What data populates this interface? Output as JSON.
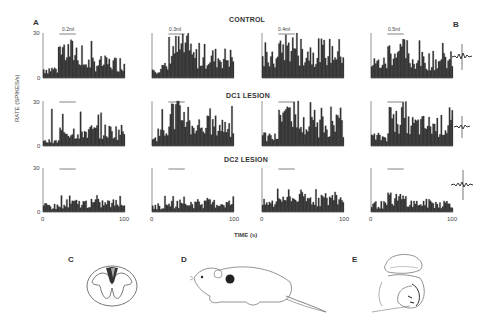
{
  "figure": {
    "panel_labels": [
      "A",
      "B",
      "C",
      "D",
      "E"
    ],
    "rows": [
      {
        "title": "CONTROL"
      },
      {
        "title": "DC1 LESION"
      },
      {
        "title": "DC2 LESION"
      }
    ],
    "stimulus_labels": [
      "0.2ml",
      "0.3ml",
      "0.4ml",
      "0.5ml"
    ],
    "y_axis_label": "RATE (SPIKES/s)",
    "x_axis_label": "TIME (s)",
    "y_ticks": [
      "0",
      "30"
    ],
    "x_ticks": [
      "0",
      "100"
    ]
  },
  "chart_data": {
    "type": "bar",
    "xlabel": "TIME (s)",
    "ylabel": "RATE (SPIKES/s)",
    "ylim": [
      0,
      30
    ],
    "xlim": [
      0,
      100
    ],
    "grid": false,
    "rows": [
      "CONTROL",
      "DC1 LESION",
      "DC2 LESION"
    ],
    "columns": [
      "0.2ml",
      "0.3ml",
      "0.4ml",
      "0.5ml"
    ],
    "stimulus_window_s": [
      20,
      40
    ],
    "panels": [
      {
        "row": "CONTROL",
        "stim": "0.2ml",
        "mean_pre": 6,
        "mean_stim": 18,
        "mean_post": 10,
        "peak": 25
      },
      {
        "row": "CONTROL",
        "stim": "0.3ml",
        "mean_pre": 7,
        "mean_stim": 20,
        "mean_post": 14,
        "peak": 25
      },
      {
        "row": "CONTROL",
        "stim": "0.4ml",
        "mean_pre": 12,
        "mean_stim": 22,
        "mean_post": 18,
        "peak": 27
      },
      {
        "row": "CONTROL",
        "stim": "0.5ml",
        "mean_pre": 10,
        "mean_stim": 18,
        "mean_post": 12,
        "peak": 27
      },
      {
        "row": "DC1 LESION",
        "stim": "0.2ml",
        "mean_pre": 3,
        "mean_stim": 10,
        "mean_post": 10,
        "peak": 26
      },
      {
        "row": "DC1 LESION",
        "stim": "0.3ml",
        "mean_pre": 8,
        "mean_stim": 22,
        "mean_post": 14,
        "peak": 30
      },
      {
        "row": "DC1 LESION",
        "stim": "0.4ml",
        "mean_pre": 6,
        "mean_stim": 24,
        "mean_post": 14,
        "peak": 30
      },
      {
        "row": "DC1 LESION",
        "stim": "0.5ml",
        "mean_pre": 6,
        "mean_stim": 20,
        "mean_post": 14,
        "peak": 28
      },
      {
        "row": "DC2 LESION",
        "stim": "0.2ml",
        "mean_pre": 4,
        "mean_stim": 6,
        "mean_post": 6,
        "peak": 12
      },
      {
        "row": "DC2 LESION",
        "stim": "0.3ml",
        "mean_pre": 4,
        "mean_stim": 6,
        "mean_post": 6,
        "peak": 11
      },
      {
        "row": "DC2 LESION",
        "stim": "0.4ml",
        "mean_pre": 6,
        "mean_stim": 10,
        "mean_post": 9,
        "peak": 17
      },
      {
        "row": "DC2 LESION",
        "stim": "0.5ml",
        "mean_pre": 5,
        "mean_stim": 9,
        "mean_post": 6,
        "peak": 15
      }
    ],
    "legend": "none",
    "side_panels": {
      "B": "spike waveform per row",
      "C": "spinal cord cross-section with dorsal column lesion",
      "D": "rat illustration with recording site",
      "E": "brain illustration with recording site"
    }
  }
}
